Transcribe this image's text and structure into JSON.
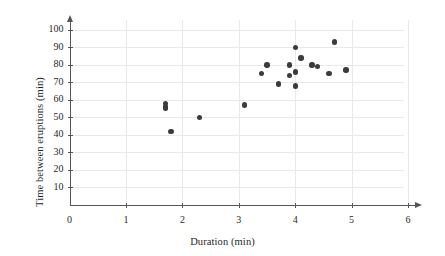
{
  "chart_data": {
    "type": "scatter",
    "title": "",
    "xlabel": "Duration (min)",
    "ylabel": "Time between eruptions (min)",
    "xlim": [
      0,
      6
    ],
    "ylim": [
      0,
      108
    ],
    "grid": true,
    "legend": "none",
    "xticks": [
      "0",
      "1",
      "2",
      "3",
      "4",
      "5",
      "6"
    ],
    "xtick_values": [
      0,
      1,
      2,
      3,
      4,
      5,
      6
    ],
    "yticks": [
      "10",
      "20",
      "30",
      "40",
      "50",
      "60",
      "70",
      "80",
      "90",
      "100"
    ],
    "ytick_values": [
      10,
      20,
      30,
      40,
      50,
      60,
      70,
      80,
      90,
      100
    ],
    "point_color": "#3b3b3b",
    "grid_color": "#e9e9e9",
    "axis_color": "#555555",
    "points": [
      {
        "x": 1.7,
        "y": 58
      },
      {
        "x": 1.7,
        "y": 56
      },
      {
        "x": 1.7,
        "y": 55
      },
      {
        "x": 1.8,
        "y": 42
      },
      {
        "x": 2.3,
        "y": 50
      },
      {
        "x": 3.1,
        "y": 57
      },
      {
        "x": 3.4,
        "y": 75
      },
      {
        "x": 3.5,
        "y": 80
      },
      {
        "x": 3.7,
        "y": 69
      },
      {
        "x": 3.9,
        "y": 80
      },
      {
        "x": 3.9,
        "y": 74
      },
      {
        "x": 4.0,
        "y": 90
      },
      {
        "x": 4.0,
        "y": 76
      },
      {
        "x": 4.0,
        "y": 68
      },
      {
        "x": 4.1,
        "y": 84
      },
      {
        "x": 4.3,
        "y": 80
      },
      {
        "x": 4.4,
        "y": 79
      },
      {
        "x": 4.6,
        "y": 75
      },
      {
        "x": 4.7,
        "y": 93
      },
      {
        "x": 4.9,
        "y": 77
      }
    ]
  },
  "axes": {
    "x_title": "Duration (min)",
    "y_title": "Time between eruptions (min)"
  }
}
